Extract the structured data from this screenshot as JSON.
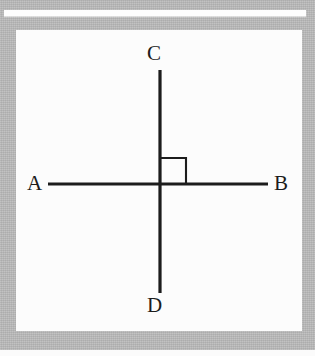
{
  "figure": {
    "type": "geometry-diagram",
    "background_color": "#b9b9b9",
    "panel_color": "#fcfcfc",
    "stroke_color": "#1c1c1c",
    "labels": {
      "top": "C",
      "bottom": "D",
      "left": "A",
      "right": "B"
    },
    "lines": [
      {
        "name": "line-AB",
        "orientation": "horizontal",
        "endpoints": [
          "A",
          "B"
        ],
        "x1": 32,
        "y1": 154,
        "x2": 252,
        "y2": 154
      },
      {
        "name": "line-CD",
        "orientation": "vertical",
        "endpoints": [
          "C",
          "D"
        ],
        "x1": 144,
        "y1": 40,
        "x2": 144,
        "y2": 263
      }
    ],
    "intersection": {
      "x": 144,
      "y": 154
    },
    "right_angle_marker": {
      "name": "right-angle-marker",
      "quadrant": "upper-right",
      "size": 26,
      "angle_degrees": 90
    },
    "stroke_width": 3,
    "marker_stroke_width": 2
  }
}
